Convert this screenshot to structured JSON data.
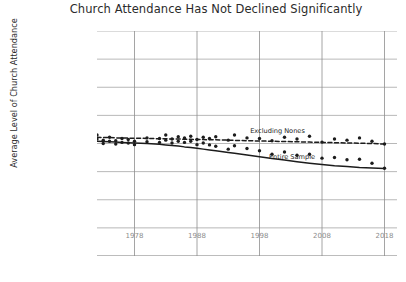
{
  "chart_data": {
    "type": "scatter",
    "title": "Church Attendance Has Not Declined Significantly",
    "xlabel": "",
    "ylabel": "Average Level of Church Attendance",
    "grid": true,
    "legend_position": "inline-annotations",
    "xlim": [
      1972,
      2020
    ],
    "ylim": [
      0,
      8
    ],
    "xticks": [
      "1978",
      "1988",
      "1998",
      "2008",
      "2018"
    ],
    "xtick_values": [
      1978,
      1988,
      1998,
      2008,
      2018
    ],
    "ytick_labels": [
      "More Than\nOnce a Week",
      "Every\nWeek",
      "Nearly\nEvery Week",
      "Two to Three Times\na Month",
      "Once\na Month",
      "Several Times\na Year",
      "Once\na Year",
      "Less Than\nOnce a Year",
      "Never"
    ],
    "ytick_values": [
      8,
      7,
      6,
      5,
      4,
      3,
      2,
      1,
      0
    ],
    "annotations": [
      {
        "text": "Excluding Nones",
        "x": 1996.5,
        "y": 4.45
      },
      {
        "text": "Entire Sample",
        "x": 1999.5,
        "y": 3.52
      }
    ],
    "series": [
      {
        "name": "Excluding Nones",
        "style": "dashed",
        "color": "#1c1c1c",
        "marker": "circle",
        "x": [
          1972,
          1973,
          1974,
          1975,
          1976,
          1977,
          1978,
          1980,
          1982,
          1983,
          1984,
          1985,
          1986,
          1987,
          1988,
          1989,
          1990,
          1991,
          1993,
          1994,
          1996,
          1998,
          2000,
          2002,
          2004,
          2006,
          2008,
          2010,
          2012,
          2014,
          2016,
          2018
        ],
        "y": [
          4.3,
          4.12,
          4.22,
          4.1,
          4.18,
          4.14,
          4.08,
          4.2,
          4.18,
          4.3,
          4.16,
          4.24,
          4.2,
          4.26,
          4.14,
          4.22,
          4.18,
          4.24,
          4.12,
          4.3,
          4.2,
          4.18,
          4.1,
          4.22,
          4.16,
          4.26,
          4.05,
          4.16,
          4.12,
          4.2,
          4.08,
          3.98
        ],
        "trend_y": [
          4.22,
          4.21,
          4.21,
          4.2,
          4.2,
          4.19,
          4.19,
          4.18,
          4.17,
          4.17,
          4.16,
          4.16,
          4.15,
          4.15,
          4.14,
          4.14,
          4.13,
          4.13,
          4.12,
          4.11,
          4.1,
          4.09,
          4.08,
          4.07,
          4.06,
          4.05,
          4.04,
          4.03,
          4.02,
          4.01,
          4.0,
          3.98
        ]
      },
      {
        "name": "Entire Sample",
        "style": "solid",
        "color": "#1c1c1c",
        "marker": "circle",
        "x": [
          1972,
          1973,
          1974,
          1975,
          1976,
          1977,
          1978,
          1980,
          1982,
          1983,
          1984,
          1985,
          1986,
          1987,
          1988,
          1989,
          1990,
          1991,
          1993,
          1994,
          1996,
          1998,
          2000,
          2002,
          2004,
          2006,
          2008,
          2010,
          2012,
          2014,
          2016,
          2018
        ],
        "y": [
          4.16,
          4.0,
          4.08,
          3.98,
          4.04,
          4.02,
          3.96,
          4.06,
          4.04,
          4.12,
          4.02,
          4.08,
          4.04,
          4.08,
          3.96,
          4.02,
          3.95,
          3.9,
          3.8,
          3.92,
          3.82,
          3.74,
          3.62,
          3.7,
          3.58,
          3.62,
          3.48,
          3.5,
          3.42,
          3.44,
          3.3,
          3.12
        ],
        "trend_y": [
          4.08,
          4.07,
          4.06,
          4.05,
          4.04,
          4.03,
          4.02,
          4.0,
          3.97,
          3.95,
          3.93,
          3.91,
          3.88,
          3.86,
          3.83,
          3.8,
          3.77,
          3.74,
          3.68,
          3.65,
          3.59,
          3.53,
          3.47,
          3.41,
          3.35,
          3.3,
          3.25,
          3.21,
          3.18,
          3.15,
          3.13,
          3.11
        ]
      }
    ]
  }
}
